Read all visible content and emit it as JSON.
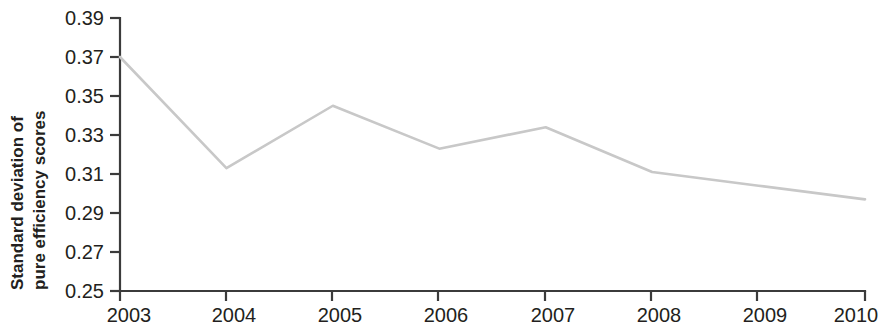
{
  "chart_data": {
    "type": "line",
    "title": "",
    "subtitle": "",
    "xlabel": "",
    "ylabel": "Standard deviation of pure efficiency scores",
    "ylabel_lines": [
      "Standard deviation of",
      "pure efficiency scores"
    ],
    "categories": [
      "2003",
      "2004",
      "2005",
      "2006",
      "2007",
      "2008",
      "2009",
      "2010"
    ],
    "x": [
      2003,
      2004,
      2005,
      2006,
      2007,
      2008,
      2009,
      2010
    ],
    "values": [
      0.37,
      0.313,
      0.345,
      0.323,
      0.334,
      0.311,
      0.304,
      0.297
    ],
    "series": [
      {
        "name": "Standard deviation of pure efficiency scores",
        "values": [
          0.37,
          0.313,
          0.345,
          0.323,
          0.334,
          0.311,
          0.304,
          0.297
        ],
        "color": "#c8c8c8"
      }
    ],
    "ylim": [
      0.25,
      0.39
    ],
    "xlim": [
      2003,
      2010
    ],
    "yticks": [
      0.25,
      0.27,
      0.29,
      0.31,
      0.33,
      0.35,
      0.37,
      0.39
    ],
    "ytick_labels": [
      "0.25",
      "0.27",
      "0.29",
      "0.31",
      "0.33",
      "0.35",
      "0.37",
      "0.39"
    ],
    "xticks": [
      2003,
      2004,
      2005,
      2006,
      2007,
      2008,
      2009,
      2010
    ],
    "xtick_labels": [
      "2003",
      "2004",
      "2005",
      "2006",
      "2007",
      "2008",
      "2009",
      "2010"
    ],
    "grid": false,
    "legend": false,
    "legend_position": "none",
    "markers": false,
    "annotations": [],
    "line_color": "#c8c8c8",
    "axis_color": "#3b3b3b",
    "text_color": "#231f20",
    "background_color": "#ffffff"
  }
}
